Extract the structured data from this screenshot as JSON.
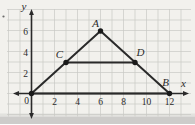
{
  "figure": {
    "axes": {
      "x_label": "x",
      "y_label": "y",
      "origin_label": "0",
      "x_ticks": [
        "2",
        "4",
        "6",
        "8",
        "10",
        "12"
      ],
      "y_ticks": [
        "6",
        "4",
        "2"
      ],
      "x_range": [
        0,
        12
      ],
      "y_range": [
        0,
        6
      ],
      "grid": "on, 1-unit squares"
    },
    "points": [
      {
        "id": "O",
        "label": "",
        "x": 0,
        "y": 0
      },
      {
        "id": "A",
        "label": "A",
        "x": 6,
        "y": 6
      },
      {
        "id": "B",
        "label": "B",
        "x": 12,
        "y": 0
      },
      {
        "id": "C",
        "label": "C",
        "x": 3,
        "y": 3
      },
      {
        "id": "D",
        "label": "D",
        "x": 9,
        "y": 3
      }
    ],
    "segments": [
      "O-A",
      "A-B",
      "O-B",
      "C-D"
    ]
  },
  "colors": {
    "paper": "#f2f1ed",
    "grid": "#c9c8c4",
    "ink": "#2a2a2a",
    "dot": "#1a1a1a",
    "shadow": "#c7c6c3"
  }
}
